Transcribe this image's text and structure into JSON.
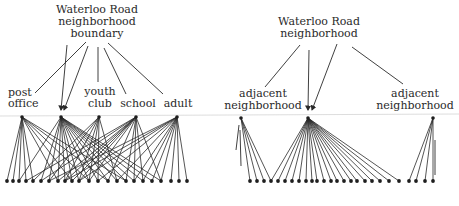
{
  "figure": {
    "left_panel": {
      "title_lines": [
        "Waterloo Road",
        "neighborhood",
        "boundary"
      ],
      "hubs": [
        {
          "id": "post_office",
          "lines": [
            "post",
            "office"
          ],
          "x": 22,
          "y": 117
        },
        {
          "id": "boundary_node",
          "lines": [],
          "x": 61,
          "y": 117
        },
        {
          "id": "youth_club",
          "lines": [
            "youth",
            "club"
          ],
          "x": 99,
          "y": 117
        },
        {
          "id": "school",
          "lines": [
            "school"
          ],
          "x": 136,
          "y": 117
        },
        {
          "id": "adult",
          "lines": [
            "adult"
          ],
          "x": 177,
          "y": 117
        }
      ],
      "leaves_x": [
        7,
        13,
        19,
        26,
        33,
        41,
        49,
        58,
        65,
        72,
        79,
        89,
        98,
        108,
        117,
        126,
        134,
        143,
        152,
        161,
        171,
        179,
        187
      ],
      "leaf_y": 181,
      "edges": {
        "post_office": [
          0,
          1,
          2,
          3,
          4,
          7,
          9,
          11,
          13,
          15
        ],
        "boundary_node": [
          2,
          5,
          6,
          7,
          8,
          9,
          10,
          11,
          12,
          13,
          14,
          15,
          16,
          17,
          18,
          19
        ],
        "youth_club": [
          4,
          6,
          8,
          10,
          11,
          12,
          14
        ],
        "school": [
          3,
          5,
          7,
          8,
          9,
          10,
          11,
          13,
          15,
          16,
          17,
          19
        ],
        "adult": [
          6,
          8,
          10,
          12,
          14,
          16,
          17,
          18,
          19,
          20,
          21,
          22
        ]
      }
    },
    "right_panel": {
      "title_lines": [
        "Waterloo Road",
        "neighborhood"
      ],
      "hubs": [
        {
          "id": "adjacent_left",
          "lines": [
            "adjacent",
            "neighborhood"
          ],
          "x": 241,
          "y": 118
        },
        {
          "id": "waterloo_node",
          "lines": [],
          "x": 308,
          "y": 118
        },
        {
          "id": "adjacent_right",
          "lines": [
            "adjacent",
            "neighborhood"
          ],
          "x": 433,
          "y": 118
        }
      ],
      "leaves_x": [
        250,
        257,
        264,
        271,
        278,
        285,
        292,
        299,
        306,
        312,
        317,
        324,
        331,
        337,
        344,
        351,
        357,
        365,
        372,
        380,
        389,
        399,
        409,
        416,
        425,
        433
      ],
      "leaf_y": 181,
      "edges": {
        "adjacent_left": [
          0,
          1,
          2,
          3
        ],
        "waterloo_node": [
          3,
          4,
          5,
          6,
          7,
          8,
          9,
          10,
          11,
          12,
          13,
          14,
          15,
          16,
          17,
          18,
          19,
          20,
          21
        ],
        "adjacent_right": [
          22,
          23,
          24,
          25
        ]
      }
    },
    "colors": {
      "ink": "#2a2a2a",
      "rule": "#cfcfcf",
      "background": "#ffffff"
    }
  }
}
